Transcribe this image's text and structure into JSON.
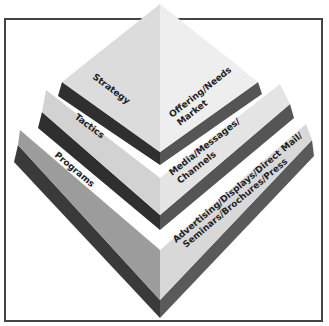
{
  "diagram": {
    "type": "layered-pyramid",
    "layers": [
      {
        "name": "Strategy",
        "description_lines": [
          "Offering/Needs",
          "Market"
        ]
      },
      {
        "name": "Tactics",
        "description_lines": [
          "Media/Messages/",
          "Channels"
        ]
      },
      {
        "name": "Programs",
        "description_lines": [
          "Advertising/Displays/Direct Mail/",
          "Seminars/Brochures/Press"
        ]
      }
    ],
    "colors": {
      "top_left_face": "#dcdcdc",
      "top_right_face": "#ececec",
      "programs_left_face": "#9a9a9a",
      "programs_right_face": "#dadada",
      "separator": "#333333",
      "frame": "#444444"
    }
  }
}
